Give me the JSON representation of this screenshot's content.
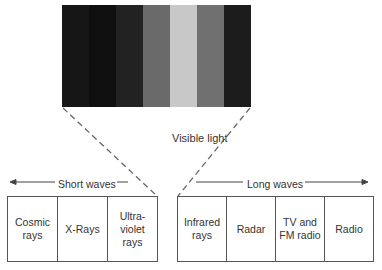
{
  "spectrum": {
    "stripes": [
      {
        "color": "#161616"
      },
      {
        "color": "#0f0f0f"
      },
      {
        "color": "#222222"
      },
      {
        "color": "#6a6a6a"
      },
      {
        "color": "#c8c8c8"
      },
      {
        "color": "#707070"
      },
      {
        "color": "#1c1c1c"
      }
    ],
    "label": "Visible light"
  },
  "short_waves": {
    "label": "Short waves",
    "cells": [
      "Cosmic\nrays",
      "X-Rays",
      "Ultra-\nviolet\nrays"
    ]
  },
  "long_waves": {
    "label": "Long waves",
    "cells": [
      "Infrared\nrays",
      "Radar",
      "TV and\nFM radio",
      "Radio"
    ]
  }
}
